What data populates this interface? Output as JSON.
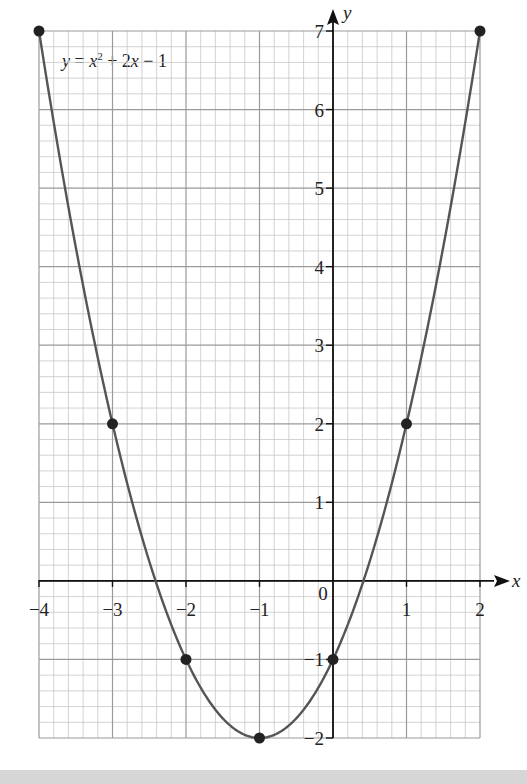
{
  "chart_data": {
    "type": "line",
    "title": "",
    "equation_label": "y = x² + 2x − 1",
    "equation": {
      "y": "y",
      "eq": " = ",
      "x1": "x",
      "sq": "2",
      "plus": " + 2",
      "x2": "x",
      "tail": " − 1"
    },
    "xlabel": "x",
    "ylabel": "y",
    "xlim": [
      -4,
      2
    ],
    "ylim": [
      -2,
      7
    ],
    "x_ticks": [
      -4,
      -3,
      -2,
      -1,
      0,
      1,
      2
    ],
    "x_tick_labels": [
      "−4",
      "−3",
      "−2",
      "−1",
      "0",
      "1",
      "2"
    ],
    "y_ticks": [
      -2,
      -1,
      1,
      2,
      3,
      4,
      5,
      6,
      7
    ],
    "y_tick_labels": [
      "−2",
      "−1",
      "1",
      "2",
      "3",
      "4",
      "5",
      "6",
      "7"
    ],
    "grid": {
      "major": true,
      "minor_per_unit": 5
    },
    "points": [
      {
        "x": -4,
        "y": 7
      },
      {
        "x": -3,
        "y": 2
      },
      {
        "x": -2,
        "y": -1
      },
      {
        "x": -1,
        "y": -2
      },
      {
        "x": 0,
        "y": -1
      },
      {
        "x": 1,
        "y": 2
      },
      {
        "x": 2,
        "y": 7
      }
    ],
    "series": [
      {
        "name": "y = x^2 + 2x - 1",
        "x": [
          -4,
          -3,
          -2,
          -1,
          0,
          1,
          2
        ],
        "values": [
          7,
          2,
          -1,
          -2,
          -1,
          2,
          7
        ]
      }
    ],
    "colors": {
      "curve": "#555555",
      "points": "#222222",
      "axes": "#111111",
      "grid_major": "#9a9a9a",
      "grid_minor": "#c8c8c8",
      "band": "#d6d6d6"
    }
  },
  "layout": {
    "x0px": 39,
    "x1px": 480,
    "y_top_px": 31,
    "y_bot_px": 738
  }
}
